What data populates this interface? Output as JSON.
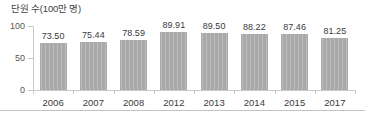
{
  "chart_data": {
    "type": "bar",
    "title": "단원 수(100만 명)",
    "xlabel": "",
    "ylabel": "",
    "ylim": [
      0,
      100
    ],
    "yticks": [
      "0",
      "50",
      "100"
    ],
    "ytick_values": [
      0,
      50,
      100
    ],
    "grid": false,
    "legend": false,
    "bar_color": "#a9a9a9",
    "axis_color": "#c9c9c9",
    "text_color": "#3a3a3a",
    "categories": [
      "2006",
      "2007",
      "2008",
      "2012",
      "2013",
      "2014",
      "2015",
      "2017"
    ],
    "values": [
      73.5,
      75.44,
      78.59,
      89.91,
      89.5,
      88.22,
      87.46,
      81.25
    ],
    "value_labels": [
      "73.50",
      "75.44",
      "78.59",
      "89.91",
      "89.50",
      "88.22",
      "87.46",
      "81.25"
    ]
  }
}
